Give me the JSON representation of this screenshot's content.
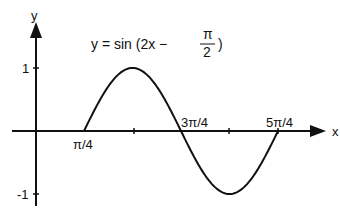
{
  "chart_data": {
    "type": "line",
    "title_parts": {
      "prefix": "y = sin (2x −",
      "num": "π",
      "den": "2",
      "suffix": ")"
    },
    "xlabel": "x",
    "ylabel": "y",
    "x_tick_labels": [
      "π/4",
      "3π/4",
      "5π/4"
    ],
    "x_ticks": [
      0.7854,
      1.5708,
      2.3562,
      3.1416,
      3.927
    ],
    "y_tick_labels": [
      "1",
      "-1"
    ],
    "y_ticks": [
      1,
      -1
    ],
    "xlim": [
      -0.2,
      4.4
    ],
    "ylim": [
      -1,
      1
    ],
    "grid": false,
    "series": [
      {
        "name": "y = sin(2x − π/2)",
        "x": [
          0.7854,
          0.9817,
          1.1781,
          1.3744,
          1.5708,
          1.7671,
          1.9635,
          2.1598,
          2.3562,
          2.5525,
          2.7489,
          2.9452,
          3.1416,
          3.3379,
          3.5343,
          3.7306,
          3.927
        ],
        "values": [
          0,
          0.383,
          0.707,
          0.924,
          1,
          0.924,
          0.707,
          0.383,
          0,
          -0.383,
          -0.707,
          -0.924,
          -1,
          -0.924,
          -0.707,
          -0.383,
          0
        ]
      }
    ]
  },
  "labels": {
    "y_axis": "y",
    "x_axis": "x",
    "y_one": "1",
    "y_neg_one": "-1",
    "x_pi4": "π/4",
    "x_3pi4": "3π/4",
    "x_5pi4": "5π/4",
    "title_prefix": "y = sin (2x −",
    "title_num": "π",
    "title_den": "2",
    "title_suffix": ")"
  }
}
